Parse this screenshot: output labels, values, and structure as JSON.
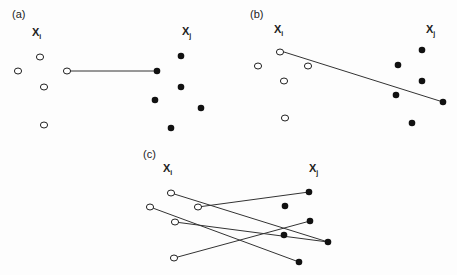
{
  "figure": {
    "colors": {
      "line": "#333333",
      "open_stroke": "#222222",
      "filled": "#111111",
      "background": "#fdfdfd"
    },
    "panels": [
      {
        "id": "a",
        "label": "(a)",
        "label_pos": [
          12,
          18
        ],
        "xi_label": {
          "main": "X",
          "sub": "i",
          "pos": [
            32,
            36
          ]
        },
        "xj_label": {
          "main": "X",
          "sub": "j",
          "pos": [
            182,
            35
          ]
        },
        "open_points": [
          [
            40,
            57
          ],
          [
            18,
            71
          ],
          [
            67,
            71
          ],
          [
            44,
            87
          ],
          [
            44,
            125
          ]
        ],
        "filled_points": [
          [
            181,
            56
          ],
          [
            157,
            71
          ],
          [
            181,
            87
          ],
          [
            155,
            100
          ],
          [
            201,
            108
          ],
          [
            171,
            128
          ]
        ],
        "lines": [
          [
            [
              67,
              71
            ],
            [
              157,
              71
            ]
          ]
        ]
      },
      {
        "id": "b",
        "label": "(b)",
        "label_pos": [
          250,
          18
        ],
        "xi_label": {
          "main": "X",
          "sub": "i",
          "pos": [
            274,
            33
          ]
        },
        "xj_label": {
          "main": "X",
          "sub": "j",
          "pos": [
            426,
            33
          ]
        },
        "open_points": [
          [
            280,
            52
          ],
          [
            258,
            66
          ],
          [
            308,
            66
          ],
          [
            284,
            81
          ],
          [
            285,
            118
          ]
        ],
        "filled_points": [
          [
            422,
            50
          ],
          [
            398,
            65
          ],
          [
            422,
            81
          ],
          [
            396,
            95
          ],
          [
            443,
            102
          ],
          [
            412,
            123
          ]
        ],
        "lines": [
          [
            [
              284,
              52
            ],
            [
              443,
              102
            ]
          ]
        ]
      },
      {
        "id": "c",
        "label": "(c)",
        "label_pos": [
          143,
          158
        ],
        "xi_label": {
          "main": "X",
          "sub": "i",
          "pos": [
            163,
            172
          ]
        },
        "xj_label": {
          "main": "X",
          "sub": "j",
          "pos": [
            309,
            172
          ]
        },
        "open_points": [
          [
            171,
            193
          ],
          [
            150,
            207
          ],
          [
            198,
            207
          ],
          [
            175,
            222
          ],
          [
            174,
            258
          ]
        ],
        "filled_points": [
          [
            309,
            192
          ],
          [
            285,
            206
          ],
          [
            310,
            221
          ],
          [
            284,
            235
          ],
          [
            328,
            242
          ],
          [
            299,
            262
          ]
        ],
        "lines": [
          [
            [
              171,
              193
            ],
            [
              328,
              242
            ]
          ],
          [
            [
              198,
              207
            ],
            [
              309,
              192
            ]
          ],
          [
            [
              150,
              207
            ],
            [
              299,
              262
            ]
          ],
          [
            [
              175,
              222
            ],
            [
              328,
              242
            ]
          ],
          [
            [
              174,
              258
            ],
            [
              310,
              221
            ]
          ]
        ]
      }
    ]
  }
}
